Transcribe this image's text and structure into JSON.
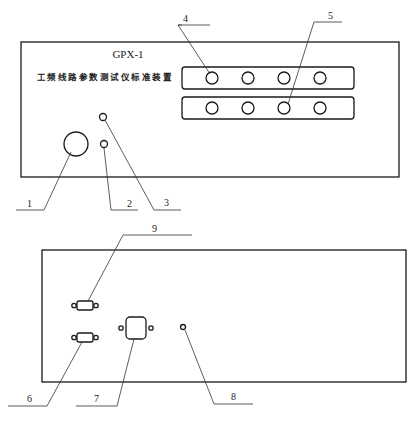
{
  "figure": {
    "front_panel": {
      "model": "GPX-1",
      "title": "工频线路参数测试仪标准装置",
      "jack_strips": [
        {
          "name": "strip-top",
          "jack_count": 4
        },
        {
          "name": "strip-bottom",
          "jack_count": 4
        }
      ]
    },
    "rear_panel": {
      "connectors": [
        "serial-port-upper",
        "serial-port-lower",
        "power-socket",
        "ground-terminal"
      ]
    },
    "callouts": [
      {
        "id": "1",
        "label": "1",
        "target": "knob"
      },
      {
        "id": "2",
        "label": "2",
        "target": "indicator-lower"
      },
      {
        "id": "3",
        "label": "3",
        "target": "indicator-upper"
      },
      {
        "id": "4",
        "label": "4",
        "target": "jack-strip-top"
      },
      {
        "id": "5",
        "label": "5",
        "target": "jack-strip-bottom"
      },
      {
        "id": "6",
        "label": "6",
        "target": "serial-port-lower"
      },
      {
        "id": "7",
        "label": "7",
        "target": "power-socket"
      },
      {
        "id": "8",
        "label": "8",
        "target": "ground-terminal"
      },
      {
        "id": "9",
        "label": "9",
        "target": "serial-port-upper"
      }
    ],
    "caption": ""
  },
  "colors": {
    "stroke": "#1a1a1a",
    "background": "#ffffff"
  }
}
